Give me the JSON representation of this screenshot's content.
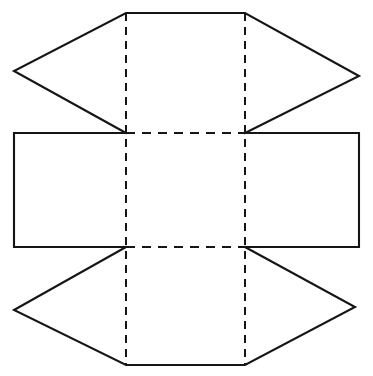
{
  "document": {
    "title": "Net of a solid",
    "description": "Unfolded net diagram: a central square face with four flaps attached on each side.",
    "background_color": "#ffffff",
    "line_color": "#151515",
    "canvas": {
      "width": 373,
      "height": 376
    }
  },
  "diagram": {
    "type": "geometric-net",
    "solid_line_style": "solid",
    "fold_line_style": "dashed",
    "solid_stroke_width": 2.1,
    "fold_stroke_width": 2.0,
    "fold_dash_vertical": "8 6",
    "fold_dash_horizontal": "9 7",
    "vertices": {
      "center_top_left": [
        126,
        133
      ],
      "center_top_right": [
        245,
        133
      ],
      "center_bottom_left": [
        126,
        247
      ],
      "center_bottom_right": [
        245,
        247
      ],
      "top_flap_top_left": [
        126,
        13
      ],
      "top_flap_top_right": [
        245,
        13
      ],
      "top_flap_left_apex": [
        14,
        71
      ],
      "top_flap_right_apex": [
        359,
        76
      ],
      "left_rect_top_left": [
        14,
        133
      ],
      "left_rect_bottom_left": [
        14,
        247
      ],
      "right_rect_top_right": [
        359,
        133
      ],
      "right_rect_bottom_right": [
        359,
        247
      ],
      "bottom_flap_bottom_left": [
        126,
        365
      ],
      "bottom_flap_bottom_right": [
        245,
        365
      ],
      "bottom_flap_left_apex": [
        14,
        310
      ],
      "bottom_flap_right_apex": [
        355,
        307
      ]
    },
    "faces": [
      {
        "name": "center-square-face",
        "shape": "square",
        "outline": "126,133 245,133 245,247 126,247",
        "edges": "all-fold"
      },
      {
        "name": "top-flap-face",
        "shape": "hexagonal-flap",
        "outline": "14,71 126,13 245,13 359,76 245,133 126,133",
        "solid_path": "M 126,133 L 14,71 L 126,13 L 245,13 L 359,76 L 245,133"
      },
      {
        "name": "left-rectangle-face",
        "shape": "rectangle",
        "outline": "14,133 126,133 126,247 14,247",
        "solid_path": "M 126,133 L 14,133 L 14,247 L 126,247"
      },
      {
        "name": "right-rectangle-face",
        "shape": "rectangle",
        "outline": "245,133 359,133 359,247 245,247",
        "solid_path": "M 245,133 L 359,133 L 359,247 L 245,247"
      },
      {
        "name": "bottom-flap-face",
        "shape": "hexagonal-flap",
        "outline": "14,310 126,365 245,365 355,307 245,247 126,247",
        "solid_path": "M 126,247 L 14,310 L 126,365 L 245,365 L 355,307 L 245,247"
      }
    ],
    "fold_lines": [
      {
        "name": "fold-vertical-left",
        "from": [
          126,
          13
        ],
        "to": [
          126,
          365
        ],
        "orientation": "vertical"
      },
      {
        "name": "fold-vertical-right",
        "from": [
          245,
          13
        ],
        "to": [
          245,
          365
        ],
        "orientation": "vertical"
      },
      {
        "name": "fold-horizontal-top",
        "from": [
          126,
          133
        ],
        "to": [
          245,
          133
        ],
        "orientation": "horizontal"
      },
      {
        "name": "fold-horizontal-bottom",
        "from": [
          126,
          247
        ],
        "to": [
          245,
          247
        ],
        "orientation": "horizontal"
      }
    ]
  }
}
